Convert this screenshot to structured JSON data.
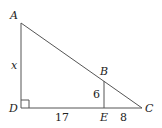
{
  "diagram": {
    "points": {
      "A": {
        "label": "A",
        "x": 21,
        "y": 23
      },
      "B": {
        "label": "B",
        "x": 104,
        "y": 80
      },
      "C": {
        "label": "C",
        "x": 142,
        "y": 108
      },
      "D": {
        "label": "D",
        "x": 21,
        "y": 108
      },
      "E": {
        "label": "E",
        "x": 104,
        "y": 108
      }
    },
    "measures": {
      "AD": "x",
      "BE": "6",
      "DE": "17",
      "EC": "8"
    },
    "colors": {
      "line": "#555555",
      "text": "#222222"
    }
  }
}
